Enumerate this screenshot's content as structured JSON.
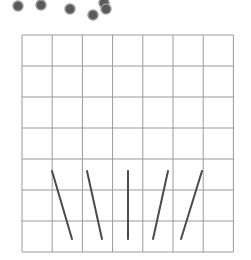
{
  "scene": {
    "width": 251,
    "height": 260,
    "background": "#ffffff"
  },
  "balls": [
    {
      "x": 18,
      "y": 6,
      "r": 5
    },
    {
      "x": 41,
      "y": 5,
      "r": 5
    },
    {
      "x": 70,
      "y": 9,
      "r": 5
    },
    {
      "x": 93,
      "y": 15,
      "r": 5
    },
    {
      "x": 104,
      "y": 3,
      "r": 5
    },
    {
      "x": 106,
      "y": 9,
      "r": 5
    }
  ],
  "ball_style": {
    "fill": "#5a5a5a",
    "stroke": "#9a9a9a"
  },
  "grid": {
    "x0": 22,
    "y0": 35,
    "cols": 7,
    "rows": 7,
    "cell_w": 30.2,
    "cell_h": 31,
    "line_color": "#9a9a9a"
  },
  "ramps": [
    {
      "x1": 52,
      "y1": 171,
      "x2": 72,
      "y2": 239
    },
    {
      "x1": 87,
      "y1": 171,
      "x2": 102,
      "y2": 239
    },
    {
      "x1": 128,
      "y1": 171,
      "x2": 128,
      "y2": 239
    },
    {
      "x1": 168,
      "y1": 171,
      "x2": 153,
      "y2": 239
    },
    {
      "x1": 202,
      "y1": 171,
      "x2": 181,
      "y2": 239
    }
  ],
  "ramp_style": {
    "stroke": "#4a4a4a",
    "width": 2
  }
}
